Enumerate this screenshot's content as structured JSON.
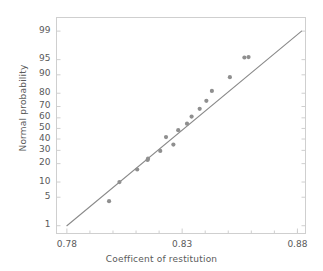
{
  "chart_data": {
    "type": "scatter",
    "title": "",
    "subtitle": "",
    "xlabel": "Coefficent of restitution",
    "ylabel": "Normal probability",
    "xlim": [
      0.7755,
      0.8835
    ],
    "ylim_percent": [
      0.6,
      99.6
    ],
    "grid": false,
    "legend": null,
    "y_scale": "normal-probability",
    "x_ticks": [
      0.78,
      0.83,
      0.88
    ],
    "x_tick_labels": [
      "0.78",
      "0.83",
      "0.88"
    ],
    "x_minor_ticks": [
      0.79,
      0.8,
      0.81,
      0.82,
      0.84,
      0.85,
      0.86,
      0.87,
      0.88
    ],
    "y_ticks": [
      1,
      5,
      10,
      20,
      30,
      40,
      50,
      60,
      70,
      80,
      90,
      95,
      99
    ],
    "y_tick_labels": [
      "1",
      "5",
      "10",
      "20",
      "30",
      "40",
      "50",
      "60",
      "70",
      "80",
      "90",
      "95",
      "99"
    ],
    "marker_color": "#8f8f8f",
    "line_color": "#8a8a8a",
    "axis_color": "#cfcfcf",
    "text_color": "#5a5a5a",
    "x": [
      0.7983,
      0.8028,
      0.8105,
      0.815,
      0.8152,
      0.8205,
      0.823,
      0.8262,
      0.8283,
      0.8321,
      0.8341,
      0.8376,
      0.8405,
      0.8429,
      0.8507,
      0.857,
      0.8588
    ],
    "y": [
      4.1,
      10.0,
      16.3,
      22.5,
      23.5,
      29.5,
      41.8,
      35.0,
      48.3,
      54.5,
      61.2,
      68.0,
      74.5,
      81.5,
      89.0,
      95.5,
      95.6
    ],
    "points": [
      {
        "x": 0.7983,
        "y": 4.1
      },
      {
        "x": 0.8028,
        "y": 10.0
      },
      {
        "x": 0.8105,
        "y": 16.3
      },
      {
        "x": 0.815,
        "y": 22.5
      },
      {
        "x": 0.8152,
        "y": 23.5
      },
      {
        "x": 0.8205,
        "y": 29.5
      },
      {
        "x": 0.823,
        "y": 41.8
      },
      {
        "x": 0.8262,
        "y": 35.0
      },
      {
        "x": 0.8283,
        "y": 48.3
      },
      {
        "x": 0.8321,
        "y": 54.5
      },
      {
        "x": 0.8341,
        "y": 61.2
      },
      {
        "x": 0.8376,
        "y": 68.0
      },
      {
        "x": 0.8405,
        "y": 74.5
      },
      {
        "x": 0.8429,
        "y": 81.5
      },
      {
        "x": 0.8507,
        "y": 89.0
      },
      {
        "x": 0.857,
        "y": 95.5
      },
      {
        "x": 0.8588,
        "y": 95.6
      }
    ],
    "reference_line": {
      "x_start": 0.78,
      "y_start": 1.0,
      "x_end": 0.8818,
      "y_end": 99.0
    }
  }
}
